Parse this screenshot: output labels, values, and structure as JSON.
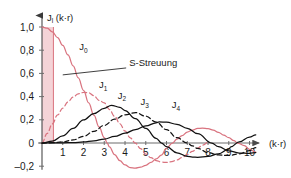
{
  "figure": {
    "background_color": "#ffffff",
    "axes": {
      "y_axis_title": "J",
      "y_axis_title_sub": "l",
      "y_axis_title_arg": " (k·r)",
      "x_axis_title": "(k·r)",
      "y_ticks": [
        "1,0",
        "0,8",
        "0,6",
        "0,4",
        "0,2",
        "0",
        "–0,2"
      ],
      "y_tick_values": [
        1.0,
        0.8,
        0.6,
        0.4,
        0.2,
        0.0,
        -0.2
      ],
      "x_ticks": [
        "1",
        "2",
        "3",
        "4",
        "5",
        "6",
        "7",
        "8",
        "9",
        "10"
      ],
      "x_tick_values": [
        1,
        2,
        3,
        4,
        5,
        6,
        7,
        8,
        9,
        10
      ],
      "xlim": [
        0,
        10.6
      ],
      "ylim": [
        -0.25,
        1.12
      ],
      "grid": false
    },
    "annotation": {
      "label": "S-Streuung",
      "description": "leader line pointing to shaded region near origin"
    },
    "shaded_region": {
      "x_start": 0,
      "x_end": 0.55,
      "y_start": 0,
      "y_end": 1.0,
      "fill_color": "#f4d3d7",
      "edge_color": "#d9737f"
    },
    "colors": {
      "red_curve": "#d9737f",
      "black_curve": "#111111",
      "axis": "#6d6d6d",
      "text": "#1a1a1a"
    }
  },
  "chart_data": {
    "type": "line",
    "title": "",
    "xlabel": "(k·r)",
    "ylabel": "J_l (k·r)",
    "xlim": [
      0,
      10.6
    ],
    "ylim": [
      -0.25,
      1.12
    ],
    "grid": false,
    "legend_position": "inline-curve-labels",
    "annotations": [
      {
        "text": "S-Streuung",
        "x": 4.2,
        "y": 0.66,
        "points_to": [
          1.0,
          0.57
        ]
      }
    ],
    "series": [
      {
        "name": "J₀",
        "label": "J",
        "label_sub": "0",
        "color": "#d9737f",
        "style": "solid",
        "label_x": 2.0,
        "label_y": 0.8,
        "description": "spherical Bessel j0(x) = sin(x)/x",
        "x": [
          0,
          0.25,
          0.5,
          0.75,
          1.0,
          1.25,
          1.5,
          1.75,
          2.0,
          2.25,
          2.5,
          2.75,
          3.0,
          3.1416,
          3.25,
          3.5,
          3.75,
          4.0,
          4.25,
          4.4934,
          4.75,
          5.0,
          5.25,
          5.5,
          5.75,
          6.0,
          6.2832,
          6.5,
          6.75,
          7.0,
          7.25,
          7.5,
          7.7253,
          8.0,
          8.25,
          8.5,
          8.75,
          9.0,
          9.25,
          9.4248,
          9.75,
          10.0,
          10.3
        ],
        "y": [
          1.0,
          0.9896,
          0.9589,
          0.9089,
          0.8415,
          0.7592,
          0.665,
          0.562,
          0.4546,
          0.3457,
          0.2394,
          0.1388,
          0.047,
          0.0,
          -0.0335,
          -0.1002,
          -0.1519,
          -0.1892,
          -0.212,
          -0.2172,
          -0.2085,
          -0.1918,
          -0.1672,
          -0.1374,
          -0.1045,
          -0.0466,
          0.0,
          0.0331,
          0.0643,
          0.0939,
          0.1113,
          0.1252,
          0.1284,
          0.1237,
          0.1113,
          0.0923,
          0.0686,
          0.0458,
          0.02,
          0.0,
          -0.0234,
          -0.0544,
          -0.079
        ]
      },
      {
        "name": "J₁",
        "label": "J",
        "label_sub": "1",
        "color": "#d9737f",
        "style": "dashed",
        "label_x": 2.95,
        "label_y": 0.47,
        "description": "spherical Bessel j1(x), max ≈ 0.44 at x ≈ 2.08",
        "x": [
          0,
          0.25,
          0.5,
          0.75,
          1.0,
          1.25,
          1.5,
          1.75,
          2.0,
          2.0816,
          2.25,
          2.5,
          2.75,
          3.0,
          3.25,
          3.5,
          3.75,
          4.0,
          4.25,
          4.4934,
          4.75,
          5.0,
          5.25,
          5.5,
          5.75,
          6.0,
          6.25,
          6.5,
          6.75,
          7.0,
          7.25,
          7.5,
          7.75,
          8.0
        ],
        "y": [
          0.0,
          0.0831,
          0.1647,
          0.2416,
          0.3012,
          0.3538,
          0.3961,
          0.4243,
          0.4354,
          0.4362,
          0.4323,
          0.408,
          0.3677,
          0.3457,
          0.2885,
          0.23,
          0.1662,
          0.1038,
          0.045,
          0.0,
          -0.0483,
          -0.0951,
          -0.1271,
          -0.151,
          -0.1647,
          -0.1678,
          -0.1612,
          -0.1462,
          -0.1247,
          -0.099,
          -0.0712,
          -0.0435,
          -0.0175,
          0.0055
        ]
      },
      {
        "name": "J₂",
        "label": "J",
        "label_sub": "2",
        "color": "#111111",
        "style": "solid",
        "label_x": 3.85,
        "label_y": 0.38,
        "description": "spherical Bessel j2(x), max ≈ 0.32 at x ≈ 3.34",
        "x": [
          0,
          0.5,
          1.0,
          1.5,
          2.0,
          2.5,
          3.0,
          3.3421,
          3.75,
          4.0,
          4.5,
          5.0,
          5.5,
          5.7635,
          6.0,
          6.5,
          7.0,
          7.25,
          7.5,
          8.0,
          8.5,
          9.0,
          9.095,
          9.5,
          10.0,
          10.3
        ],
        "y": [
          0.0,
          0.0165,
          0.062,
          0.1254,
          0.1985,
          0.2538,
          0.2988,
          0.3254,
          0.3076,
          0.28,
          0.2103,
          0.1254,
          0.0406,
          0.0,
          -0.0318,
          -0.0841,
          -0.115,
          -0.1216,
          -0.1231,
          -0.116,
          -0.0935,
          -0.0537,
          -0.0334,
          0.0102,
          0.0512,
          0.0701
        ]
      },
      {
        "name": "J₃",
        "label": "J",
        "label_sub": "3",
        "color": "#111111",
        "style": "dashed",
        "label_x": 4.95,
        "label_y": 0.325,
        "description": "spherical Bessel j3(x), max ≈ 0.27 at x ≈ 4.51",
        "x": [
          0,
          0.5,
          1.0,
          1.5,
          2.0,
          2.5,
          3.0,
          3.5,
          4.0,
          4.5143,
          5.0,
          5.5,
          6.0,
          6.5,
          6.9879,
          7.25,
          7.5,
          8.0,
          8.5,
          9.0,
          9.5,
          10.0,
          10.3
        ],
        "y": [
          0.0,
          0.0024,
          0.009,
          0.0264,
          0.0577,
          0.0999,
          0.1518,
          0.2057,
          0.2429,
          0.2615,
          0.2311,
          0.1797,
          0.1147,
          0.0458,
          0.0,
          -0.0245,
          -0.0471,
          -0.0831,
          -0.1032,
          -0.1073,
          -0.093,
          -0.0655,
          -0.0404
        ]
      },
      {
        "name": "J₄",
        "label": "J",
        "label_sub": "4",
        "color": "#111111",
        "style": "solid",
        "label_x": 6.45,
        "label_y": 0.3,
        "description": "spherical Bessel j4(x), max ≈ 0.24 at x ≈ 5.65",
        "x": [
          0,
          1.0,
          1.5,
          2.0,
          2.5,
          3.0,
          3.5,
          4.0,
          4.5,
          5.0,
          5.5,
          5.6459,
          6.0,
          6.5,
          7.0,
          7.5,
          8.1826,
          8.5,
          9.0,
          9.5,
          10.0,
          10.3
        ],
        "y": [
          0.0,
          0.0011,
          0.0036,
          0.0089,
          0.0187,
          0.0339,
          0.0566,
          0.0841,
          0.1164,
          0.1474,
          0.1745,
          0.1815,
          0.1796,
          0.161,
          0.1269,
          0.0811,
          0.0,
          -0.0322,
          -0.0677,
          -0.0867,
          -0.0898,
          -0.082
        ]
      }
    ]
  }
}
